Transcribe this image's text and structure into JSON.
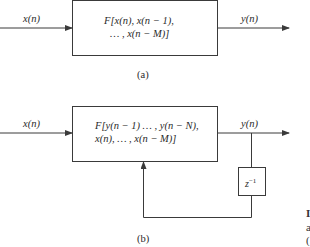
{
  "diagram_a": {
    "input_label": "x(n)",
    "output_label": "y(n)",
    "block_line1": "F[x(n), x(n − 1),",
    "block_line2": "… , x(n − M)]",
    "caption": "(a)"
  },
  "diagram_b": {
    "input_label": "x(n)",
    "output_label": "y(n)",
    "block_line1": "F[y(n − 1) … , y(n − N),",
    "block_line2": "x(n), … , x(n − M)]",
    "delay_base": "z",
    "delay_exp": "−1",
    "caption": "(b)"
  },
  "cropped_edge_text": [
    "I",
    "a",
    "("
  ],
  "colors": {
    "line": "#3a3a3a",
    "background": "#ffffff"
  }
}
